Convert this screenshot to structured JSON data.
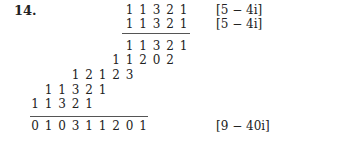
{
  "problem": {
    "number": "14.",
    "rows": [
      {
        "digits": [
          "1",
          "1",
          "3",
          "2",
          "1"
        ],
        "start_col": 7,
        "top": 3
      },
      {
        "digits": [
          "1",
          "1",
          "3",
          "2",
          "1"
        ],
        "start_col": 7,
        "top": 17
      },
      {
        "digits": [
          "1",
          "1",
          "3",
          "2",
          "1"
        ],
        "start_col": 7,
        "top": 39
      },
      {
        "digits": [
          "1",
          "1",
          "2",
          "0",
          "2"
        ],
        "start_col": 6,
        "top": 53
      },
      {
        "digits": [
          "1",
          "2",
          "1",
          "2",
          "3"
        ],
        "start_col": 3,
        "top": 68
      },
      {
        "digits": [
          "1",
          "1",
          "3",
          "2",
          "1"
        ],
        "start_col": 1,
        "top": 83
      },
      {
        "digits": [
          "1",
          "1",
          "3",
          "2",
          "1"
        ],
        "start_col": 0,
        "top": 97
      },
      {
        "digits": [
          "0",
          "1",
          "0",
          "3",
          "1",
          "1",
          "2",
          "0",
          "1"
        ],
        "start_col": 0,
        "top": 119
      }
    ],
    "annotations": [
      {
        "text": "[5 − 4i]",
        "top": 3
      },
      {
        "text": "[5 − 4i]",
        "top": 17
      },
      {
        "text": "[9 − 40i]",
        "top": 119
      }
    ],
    "rules": [
      {
        "left": 122,
        "width": 68,
        "top": 33
      },
      {
        "left": 30,
        "width": 118,
        "top": 116
      }
    ]
  }
}
